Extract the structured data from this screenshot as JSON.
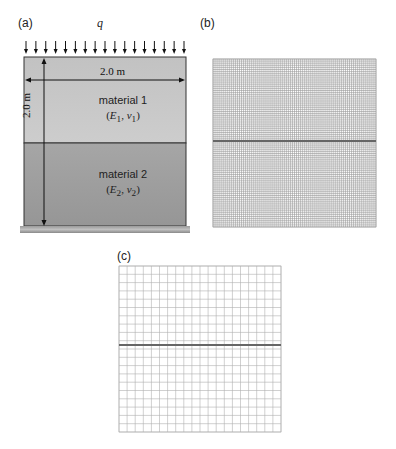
{
  "panel_a": {
    "label": "(a)",
    "load_label": "q",
    "load_arrow_count": 17,
    "width_label": "2.0 m",
    "height_label": "2.0 m",
    "material1": {
      "name": "material 1",
      "symbols": "(E1, ν1)",
      "E": "E",
      "E_sub": "1",
      "nu": "ν",
      "nu_sub": "1",
      "color": "#c8c8c8"
    },
    "material2": {
      "name": "material 2",
      "symbols": "(E2, ν2)",
      "E": "E",
      "E_sub": "2",
      "nu": "ν",
      "nu_sub": "2",
      "color": "#a0a0a0"
    },
    "ground_color": "#8a8a8a"
  },
  "panel_b": {
    "label": "(b)",
    "mesh_divisions": 80,
    "interface_color": "#666666"
  },
  "panel_c": {
    "label": "(c)",
    "mesh_divisions": 20,
    "interface_color": "#666666"
  }
}
